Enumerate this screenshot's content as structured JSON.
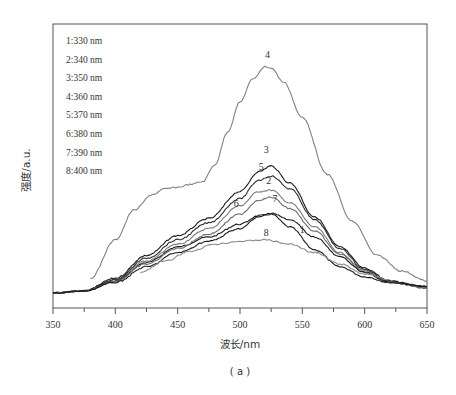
{
  "chart_data": {
    "type": "line",
    "title": "",
    "caption": "( a )",
    "xlabel": "波长/nm",
    "ylabel": "强度/a.u.",
    "xlim": [
      350,
      650
    ],
    "ylim": [
      0,
      100
    ],
    "x_ticks": [
      350,
      400,
      450,
      500,
      550,
      600,
      650
    ],
    "x_minor_ticks": [
      375,
      425,
      475,
      525,
      575,
      625
    ],
    "y_ticks": [],
    "grid": false,
    "legend_position": "upper-left (text list)",
    "legend": [
      "1:330 nm",
      "2:340 nm",
      "3:350 nm",
      "4:360 nm",
      "5:370 nm",
      "6:380 nm",
      "7:390 nm",
      "8:400 nm"
    ],
    "series": [
      {
        "name": "1",
        "excitation": "330 nm",
        "color": "#1a1a1a",
        "x": [
          350,
          375,
          400,
          425,
          450,
          475,
          500,
          515,
          525,
          540,
          560,
          580,
          600,
          620
        ],
        "y": [
          5.3,
          6.0,
          9.5,
          16.0,
          21.5,
          25.0,
          29.5,
          32.5,
          33.0,
          28.5,
          20.5,
          14.5,
          11.0,
          9.0
        ]
      },
      {
        "name": "2",
        "excitation": "340 nm",
        "color": "#7a7a7a",
        "x": [
          350,
          375,
          400,
          425,
          450,
          475,
          500,
          515,
          525,
          540,
          560,
          580,
          600,
          620,
          650
        ],
        "y": [
          5.3,
          6.0,
          10.0,
          16.5,
          22.5,
          28.0,
          36.0,
          41.0,
          41.5,
          37.0,
          28.5,
          19.5,
          13.0,
          9.0,
          7.0
        ]
      },
      {
        "name": "3",
        "excitation": "350 nm",
        "color": "#1a1a1a",
        "x": [
          350,
          375,
          400,
          425,
          450,
          475,
          500,
          515,
          525,
          540,
          560,
          580,
          600,
          620,
          650
        ],
        "y": [
          5.3,
          6.0,
          10.5,
          18.5,
          25.5,
          31.5,
          41.0,
          48.0,
          50.0,
          44.0,
          32.0,
          21.5,
          14.0,
          9.5,
          7.5
        ]
      },
      {
        "name": "4",
        "excitation": "360 nm",
        "color": "#808080",
        "x": [
          380,
          400,
          415,
          430,
          440,
          450,
          460,
          470,
          480,
          490,
          500,
          510,
          520,
          525,
          535,
          550,
          570,
          590,
          610,
          630,
          650
        ],
        "y": [
          10.5,
          24.0,
          34.5,
          40.0,
          42.0,
          42.5,
          43.5,
          44.5,
          50.5,
          62.0,
          72.5,
          80.5,
          85.0,
          84.5,
          79.5,
          67.0,
          47.0,
          30.5,
          18.5,
          13.0,
          9.5
        ]
      },
      {
        "name": "5",
        "excitation": "370 nm",
        "color": "#2a2a2a",
        "x": [
          350,
          375,
          400,
          425,
          450,
          475,
          500,
          515,
          525,
          540,
          560,
          580,
          600,
          620,
          650
        ],
        "y": [
          5.3,
          6.0,
          10.0,
          17.5,
          24.0,
          30.0,
          38.5,
          45.0,
          46.5,
          42.0,
          31.0,
          21.0,
          13.5,
          9.5,
          7.5
        ]
      },
      {
        "name": "6",
        "excitation": "380 nm",
        "color": "#6a6a6a",
        "x": [
          350,
          375,
          400,
          425,
          450,
          475,
          500,
          515,
          525,
          540,
          560,
          580,
          600,
          620,
          650
        ],
        "y": [
          5.3,
          6.0,
          9.5,
          15.5,
          21.0,
          26.0,
          33.0,
          38.0,
          39.0,
          35.0,
          27.0,
          19.0,
          12.5,
          9.0,
          7.0
        ]
      },
      {
        "name": "7",
        "excitation": "390 nm",
        "color": "#1a1a1a",
        "x": [
          350,
          375,
          400,
          425,
          450,
          475,
          500,
          515,
          525,
          540,
          560,
          580,
          600,
          620,
          650
        ],
        "y": [
          5.3,
          6.0,
          9.0,
          14.5,
          19.5,
          23.5,
          28.0,
          32.0,
          33.5,
          31.0,
          25.0,
          18.0,
          12.5,
          9.0,
          7.5
        ]
      },
      {
        "name": "8",
        "excitation": "400 nm",
        "color": "#8a8a8a",
        "x": [
          420,
          440,
          460,
          480,
          500,
          520,
          540,
          560,
          580,
          600,
          620
        ],
        "y": [
          12.5,
          16.5,
          20.0,
          22.5,
          23.5,
          24.0,
          22.5,
          19.5,
          15.5,
          12.0,
          10.0
        ]
      }
    ],
    "curve_labels": [
      {
        "text": "4",
        "x": 522,
        "y": 88
      },
      {
        "text": "3",
        "x": 521,
        "y": 54.5
      },
      {
        "text": "5",
        "x": 517,
        "y": 48.5
      },
      {
        "text": "2",
        "x": 523,
        "y": 43.5
      },
      {
        "text": "6",
        "x": 497,
        "y": 35.5
      },
      {
        "text": "7",
        "x": 528,
        "y": 37.5
      },
      {
        "text": "1",
        "x": 550,
        "y": 26.5
      },
      {
        "text": "8",
        "x": 521,
        "y": 25.5
      }
    ]
  }
}
